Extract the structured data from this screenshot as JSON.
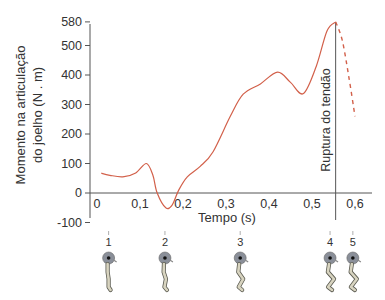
{
  "chart_data": {
    "type": "line",
    "title": "",
    "xlabel": "Tempo (s)",
    "ylabel_lines": [
      "Momento na articulação",
      "do joelho (N . m)"
    ],
    "ylabel": "Momento na articulação do joelho (N . m)",
    "xlim": [
      0,
      0.62
    ],
    "ylim": [
      -100,
      580
    ],
    "grid": false,
    "legend": null,
    "x_ticks": [
      {
        "value": 0,
        "label": "0"
      },
      {
        "value": 0.1,
        "label": "0,1"
      },
      {
        "value": 0.2,
        "label": "0,2"
      },
      {
        "value": 0.3,
        "label": "0,3"
      },
      {
        "value": 0.4,
        "label": "0,4"
      },
      {
        "value": 0.5,
        "label": "0,5"
      },
      {
        "value": 0.6,
        "label": "0,6"
      }
    ],
    "y_ticks": [
      {
        "value": -100,
        "label": "-100"
      },
      {
        "value": 0,
        "label": "0"
      },
      {
        "value": 100,
        "label": "100"
      },
      {
        "value": 200,
        "label": "200"
      },
      {
        "value": 300,
        "label": "300"
      },
      {
        "value": 400,
        "label": "400"
      },
      {
        "value": 500,
        "label": "500"
      },
      {
        "value": 580,
        "label": "580"
      }
    ],
    "series": [
      {
        "name": "Momento (medido)",
        "style": "solid",
        "color": "#d2604a",
        "x": [
          0.01,
          0.03,
          0.06,
          0.09,
          0.115,
          0.13,
          0.14,
          0.16,
          0.175,
          0.19,
          0.21,
          0.24,
          0.27,
          0.31,
          0.34,
          0.38,
          0.42,
          0.45,
          0.48,
          0.51,
          0.535,
          0.555
        ],
        "y": [
          67,
          60,
          55,
          68,
          100,
          60,
          0,
          -50,
          -40,
          10,
          55,
          90,
          140,
          260,
          335,
          370,
          410,
          375,
          337,
          430,
          550,
          580
        ]
      },
      {
        "name": "Momento (após ruptura)",
        "style": "dashed",
        "color": "#d2604a",
        "x": [
          0.555,
          0.57,
          0.585,
          0.6
        ],
        "y": [
          580,
          520,
          400,
          260
        ]
      }
    ],
    "annotations": [
      {
        "type": "vline",
        "x": 0.555,
        "label": "Ruptura do tendão"
      }
    ],
    "phases": [
      {
        "label": "1",
        "x": 0.027
      },
      {
        "label": "2",
        "x": 0.158
      },
      {
        "label": "3",
        "x": 0.333
      },
      {
        "label": "4",
        "x": 0.542
      },
      {
        "label": "5",
        "x": 0.595
      }
    ]
  },
  "figures": {
    "label_1": "1",
    "label_2": "2",
    "label_3": "3",
    "label_4": "4",
    "label_5": "5"
  },
  "colors": {
    "curve": "#d2604a",
    "axis": "#555555",
    "text": "#333333",
    "figure_head": "#8a8f99",
    "figure_body": "#d8d4c0"
  }
}
